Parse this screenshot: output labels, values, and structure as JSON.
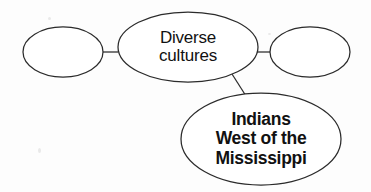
{
  "diagram": {
    "type": "concept-map",
    "title": "",
    "background_color": "#fdfdfd",
    "stroke_color": "#2b2b2b",
    "text_color": "#111111",
    "nodes": [
      {
        "id": "left",
        "name": "empty-oval-left",
        "label": "",
        "filled": false,
        "bold": false,
        "cx": 63,
        "cy": 52,
        "rx": 40,
        "ry": 25
      },
      {
        "id": "center",
        "name": "diverse-cultures-oval",
        "label": "Diverse cultures",
        "lines": [
          "Diverse",
          "cultures"
        ],
        "filled": false,
        "bold": false,
        "cx": 188,
        "cy": 47,
        "rx": 70,
        "ry": 35
      },
      {
        "id": "right",
        "name": "empty-oval-right",
        "label": "",
        "filled": false,
        "bold": false,
        "cx": 310,
        "cy": 52,
        "rx": 40,
        "ry": 25
      },
      {
        "id": "bottom",
        "name": "indians-west-of-the-mississippi-oval",
        "label": "Indians West of the Mississippi",
        "lines": [
          "Indians",
          "West of the",
          "Mississippi"
        ],
        "filled": false,
        "bold": true,
        "cx": 261,
        "cy": 139,
        "rx": 80,
        "ry": 46
      }
    ],
    "connectors": [
      {
        "name": "connector-left-to-center",
        "from": "left",
        "to": "center",
        "x1": 103,
        "y1": 52,
        "x2": 118,
        "y2": 52
      },
      {
        "name": "connector-center-to-right",
        "from": "center",
        "to": "right",
        "x1": 257,
        "y1": 52,
        "x2": 270,
        "y2": 52
      },
      {
        "name": "connector-center-to-bottom",
        "from": "center",
        "to": "bottom",
        "x1": 232,
        "y1": 74,
        "x2": 246,
        "y2": 96
      }
    ]
  }
}
